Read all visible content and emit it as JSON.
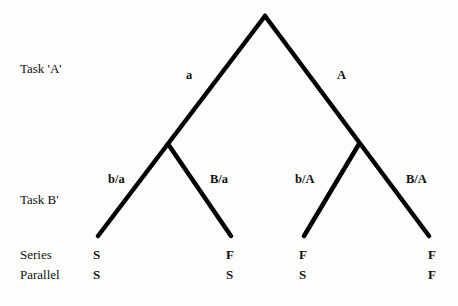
{
  "row_labels": {
    "task_a": "Task  'A'",
    "task_b": "Task B'",
    "series": "Series",
    "parallel": "Parallel"
  },
  "branches": {
    "a": "a",
    "A": "A",
    "b_given_a": "b/a",
    "B_given_a": "B/a",
    "b_given_A": "b/A",
    "B_given_A": "B/A"
  },
  "outcomes": {
    "series": [
      "S",
      "F",
      "F",
      "F"
    ],
    "parallel": [
      "S",
      "S",
      "S",
      "F"
    ]
  },
  "colors": {
    "line": "#000000",
    "background": "#fdfdfc"
  }
}
